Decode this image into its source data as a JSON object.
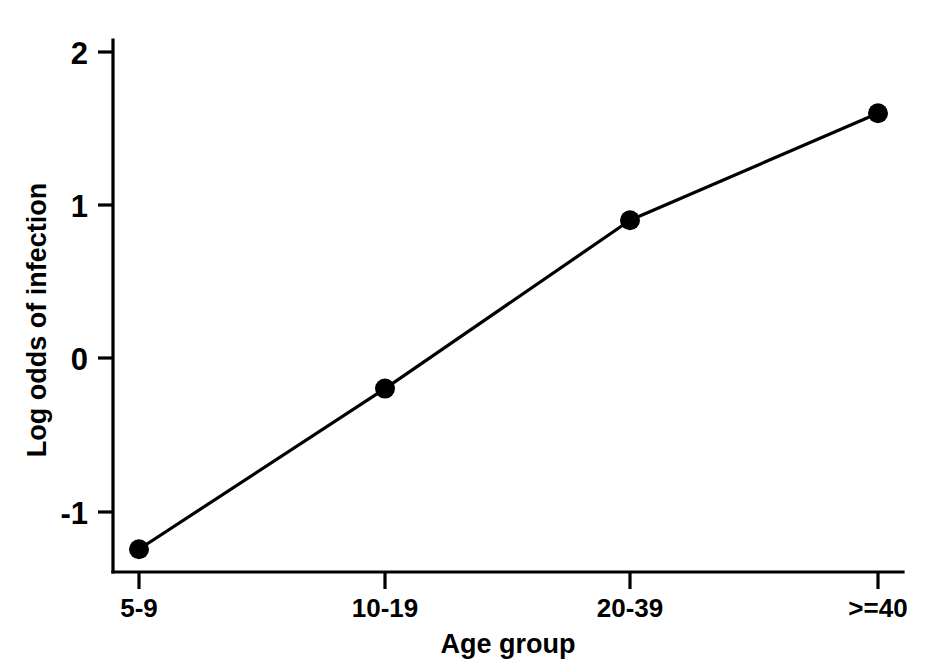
{
  "chart_data": {
    "type": "line",
    "title": "",
    "xlabel": "Age group",
    "ylabel": "Log odds of infection",
    "categories": [
      "5-9",
      "10-19",
      "20-39",
      ">=40"
    ],
    "values": [
      -1.25,
      -0.2,
      0.9,
      1.6
    ],
    "series": [
      {
        "name": "Log odds of infection",
        "values": [
          -1.25,
          -0.2,
          0.9,
          1.6
        ]
      }
    ],
    "ylim": [
      -1.45,
      2.1
    ],
    "yticks": [
      2,
      1,
      0,
      -1
    ],
    "ytick_labels": [
      "2",
      "1",
      "0",
      "-1"
    ],
    "xtick_labels": [
      "5-9",
      "10-19",
      "20-39",
      ">=40"
    ],
    "grid": false,
    "legend": "none",
    "marker": "filled-circle",
    "line_color": "#000000",
    "marker_color": "#000000",
    "background_color": "#ffffff"
  },
  "axes": {
    "y_title": "Log odds of infection",
    "x_title": "Age group",
    "y_ticks": [
      {
        "label": "2",
        "value": 2
      },
      {
        "label": "1",
        "value": 1
      },
      {
        "label": "0",
        "value": 0
      },
      {
        "label": "-1",
        "value": -1
      }
    ],
    "x_ticks": [
      {
        "label": "5-9",
        "index": 0
      },
      {
        "label": "10-19",
        "index": 1
      },
      {
        "label": "20-39",
        "index": 2
      },
      {
        "label": ">=40",
        "index": 3
      }
    ]
  },
  "caption": {
    "cut_off_text": ""
  }
}
